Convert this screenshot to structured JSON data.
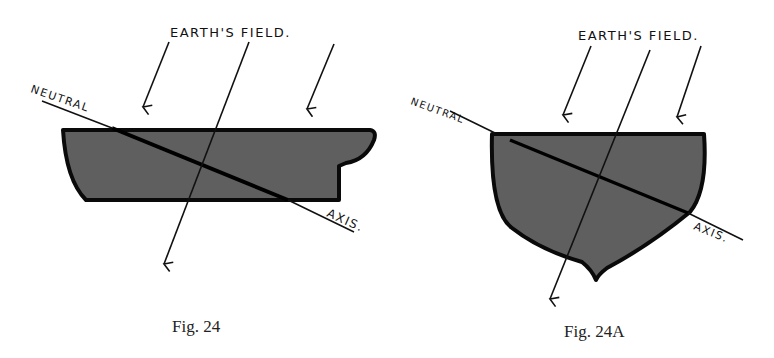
{
  "figures": [
    {
      "id": "fig24",
      "caption": "Fig. 24",
      "labels": {
        "field": "EARTH'S FIELD.",
        "neutral": "NEUTRAL",
        "axis": "AXIS."
      }
    },
    {
      "id": "fig24a",
      "caption": "Fig. 24A",
      "labels": {
        "field": "EARTH'S FIELD.",
        "neutral": "NEUTRAL",
        "axis": "AXIS."
      }
    }
  ],
  "colors": {
    "shape_fill": "#5f5f5f",
    "outline": "#0a0a0a",
    "background": "#ffffff"
  }
}
